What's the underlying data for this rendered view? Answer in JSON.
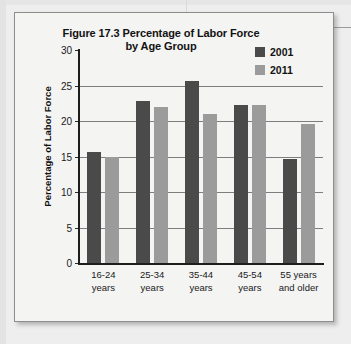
{
  "chart_data": {
    "type": "bar",
    "title": "Figure 17.3 Percentage of Labor Force by Age Group",
    "title_line1": "Figure 17.3 Percentage of Labor Force",
    "title_line2": "by Age Group",
    "xlabel": "",
    "ylabel": "Percentage of Labor Force",
    "ylim": [
      0,
      30
    ],
    "ytick_labels": [
      "0",
      "5",
      "10",
      "15",
      "20",
      "25",
      "30"
    ],
    "ytick_values": [
      0,
      5,
      10,
      15,
      20,
      25,
      30
    ],
    "grid": true,
    "legend_position": "top-right",
    "categories": [
      "16-24 years",
      "25-34 years",
      "35-44 years",
      "45-54 years",
      "55 years and older"
    ],
    "category_lines": [
      [
        "16-24",
        "years"
      ],
      [
        "25-34",
        "years"
      ],
      [
        "35-44",
        "years"
      ],
      [
        "45-54",
        "years"
      ],
      [
        "55 years",
        "and older"
      ]
    ],
    "series": [
      {
        "name": "2001",
        "color": "#4a4a4a",
        "values": [
          15.7,
          22.8,
          25.7,
          22.2,
          14.6
        ]
      },
      {
        "name": "2011",
        "color": "#9b9b9b",
        "values": [
          15.0,
          22.0,
          21.0,
          22.2,
          19.6
        ]
      }
    ]
  },
  "legend": {
    "items": [
      {
        "label": "2001",
        "color": "#4a4a4a"
      },
      {
        "label": "2011",
        "color": "#9b9b9b"
      }
    ]
  },
  "colors": {
    "panel_background": "#f4f4f3",
    "page_background": "#eeeeee",
    "axis": "#1d1d1d",
    "gridline": "#7d7d7d",
    "text": "#121212"
  }
}
